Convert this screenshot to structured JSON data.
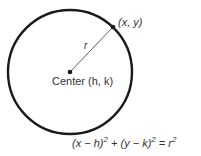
{
  "diagram": {
    "point_label": "(x, y)",
    "radius_label": "r",
    "center_label": "Center (h, k)",
    "equation": {
      "part1": "(x − h)",
      "exp1": "2",
      "plus": " + ",
      "part2": "(y − k)",
      "exp2": "2",
      "equals": " = r",
      "exp3": "2"
    },
    "colors": {
      "stroke": "#1a1a1a",
      "text": "#333333"
    }
  }
}
